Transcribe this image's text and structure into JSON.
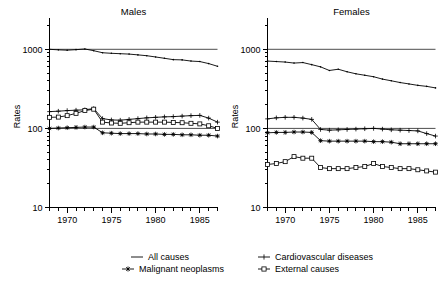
{
  "figure": {
    "ylabel": "Rates",
    "y_scale": "log",
    "y_ticks": [
      10,
      100,
      1000
    ],
    "y_tick_labels": [
      "10",
      "100",
      "1000"
    ],
    "ylim": [
      10,
      2000
    ],
    "x_ticks": [
      1970,
      1975,
      1980,
      1985
    ],
    "x_tick_labels": [
      "1970",
      "1975",
      "1980",
      "1985"
    ],
    "xlim": [
      1968,
      1987
    ],
    "grid": false,
    "legend_position": "bottom"
  },
  "legend": {
    "items": [
      {
        "label": "All causes",
        "marker": "line"
      },
      {
        "label": "Cardiovascular diseases",
        "marker": "plus"
      },
      {
        "label": "Malignant neoplasms",
        "marker": "star"
      },
      {
        "label": "External causes",
        "marker": "square"
      }
    ]
  },
  "chart_data": [
    {
      "type": "line",
      "title": "Males",
      "xlabel": "",
      "ylabel": "Rates",
      "y_scale": "log",
      "ylim": [
        10,
        2000
      ],
      "xlim": [
        1968,
        1987
      ],
      "x": [
        1968,
        1969,
        1970,
        1971,
        1972,
        1973,
        1974,
        1975,
        1976,
        1977,
        1978,
        1979,
        1980,
        1981,
        1982,
        1983,
        1984,
        1985,
        1986,
        1987
      ],
      "reference_line": 1000,
      "series": [
        {
          "name": "All causes",
          "marker": "line",
          "values": [
            1000,
            985,
            975,
            990,
            1010,
            960,
            905,
            890,
            880,
            870,
            850,
            830,
            800,
            770,
            740,
            735,
            710,
            700,
            660,
            610
          ]
        },
        {
          "name": "Cardiovascular diseases",
          "marker": "plus",
          "values": [
            163,
            165,
            168,
            170,
            172,
            178,
            133,
            128,
            127,
            130,
            133,
            136,
            138,
            140,
            141,
            143,
            145,
            146,
            135,
            120
          ]
        },
        {
          "name": "Malignant neoplasms",
          "marker": "star",
          "values": [
            100,
            101,
            102,
            103,
            104,
            104,
            88,
            87,
            86,
            86,
            86,
            85,
            85,
            84,
            84,
            83,
            83,
            82,
            82,
            80
          ]
        },
        {
          "name": "External causes",
          "marker": "square",
          "values": [
            138,
            139,
            145,
            155,
            168,
            175,
            120,
            117,
            116,
            118,
            120,
            120,
            120,
            120,
            119,
            118,
            116,
            114,
            108,
            100
          ]
        }
      ]
    },
    {
      "type": "line",
      "title": "Females",
      "xlabel": "",
      "ylabel": "Rates",
      "y_scale": "log",
      "ylim": [
        10,
        2000
      ],
      "xlim": [
        1968,
        1987
      ],
      "x": [
        1968,
        1969,
        1970,
        1971,
        1972,
        1973,
        1974,
        1975,
        1976,
        1977,
        1978,
        1979,
        1980,
        1981,
        1982,
        1983,
        1984,
        1985,
        1986,
        1987
      ],
      "reference_line": 1000,
      "series": [
        {
          "name": "All causes",
          "marker": "line",
          "values": [
            710,
            700,
            690,
            670,
            680,
            640,
            600,
            540,
            560,
            520,
            490,
            470,
            450,
            420,
            400,
            380,
            365,
            350,
            340,
            325
          ]
        },
        {
          "name": "Cardiovascular diseases",
          "marker": "plus",
          "values": [
            132,
            136,
            138,
            138,
            135,
            130,
            97,
            95,
            96,
            97,
            98,
            99,
            100,
            98,
            96,
            95,
            94,
            93,
            86,
            80
          ]
        },
        {
          "name": "Malignant neoplasms",
          "marker": "star",
          "values": [
            88,
            89,
            89,
            90,
            90,
            89,
            70,
            69,
            69,
            69,
            69,
            69,
            68,
            68,
            67,
            64,
            64,
            64,
            64,
            64
          ]
        },
        {
          "name": "External causes",
          "marker": "square",
          "values": [
            35,
            36,
            38,
            44,
            42,
            42,
            32,
            31,
            31,
            31,
            32,
            33,
            36,
            33,
            32,
            31,
            31,
            30,
            29,
            28
          ]
        }
      ]
    }
  ]
}
